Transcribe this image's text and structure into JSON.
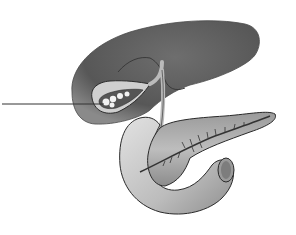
{
  "diagram": {
    "structures": [
      {
        "id": "liver",
        "label": ""
      },
      {
        "id": "gallbladder",
        "label": ""
      },
      {
        "id": "bile-duct",
        "label": ""
      },
      {
        "id": "pancreas",
        "label": ""
      },
      {
        "id": "pancreatic-duct",
        "label": ""
      },
      {
        "id": "duodenum",
        "label": ""
      }
    ],
    "leader_line": {
      "target": "gallbladder",
      "label": ""
    },
    "colors": {
      "liver": "#5c5c5c",
      "liver_highlight": "#7a7a7a",
      "gallbladder_wall": "#c8c8c8",
      "pancreas": "#a8a8a8",
      "duodenum": "#d0d0d0",
      "outline": "#2a2a2a",
      "background": "#ffffff"
    }
  }
}
